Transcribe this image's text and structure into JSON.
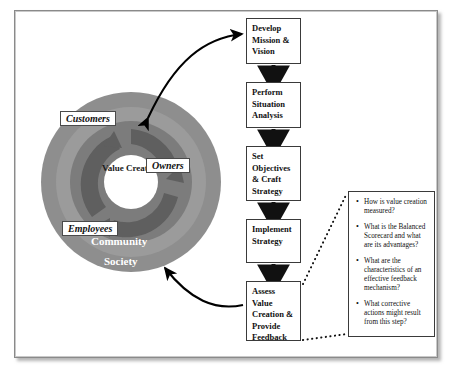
{
  "diagram": {
    "circle": {
      "core_label": "Value Creation",
      "rings": [
        {
          "name": "society",
          "label": "Society",
          "color": "#8e8e8e"
        },
        {
          "name": "community",
          "label": "Community",
          "color": "#9b9b9b"
        },
        {
          "name": "stakeholders",
          "label": "",
          "color": "#7c7c7c"
        }
      ],
      "stakeholders": [
        {
          "name": "customers",
          "label": "Customers"
        },
        {
          "name": "owners",
          "label": "Owners"
        },
        {
          "name": "employees",
          "label": "Employees"
        }
      ]
    },
    "flow": {
      "steps": [
        {
          "id": "develop",
          "label": "Develop Mission & Vision"
        },
        {
          "id": "perform",
          "label": "Perform Situation Analysis"
        },
        {
          "id": "set",
          "label": "Set Objectives & Craft Strategy"
        },
        {
          "id": "implement",
          "label": "Implement Strategy"
        },
        {
          "id": "assess",
          "label": "Assess Value Creation & Provide Feedback"
        }
      ]
    },
    "callout": {
      "questions": [
        "How is value creation measured?",
        "What is the Balanced Scorecard and what are its advantages?",
        "What are the characteristics of an effective feedback mechanism?",
        "What corrective actions might result from this step?"
      ]
    },
    "colors": {
      "ring_outer": "#8e8e8e",
      "ring_middle": "#9b9b9b",
      "ring_inner": "#7c7c7c",
      "arrow_dark": "#5f5f5f",
      "box_border": "#3a3a3a",
      "frame_border": "#8a8a8a"
    }
  }
}
